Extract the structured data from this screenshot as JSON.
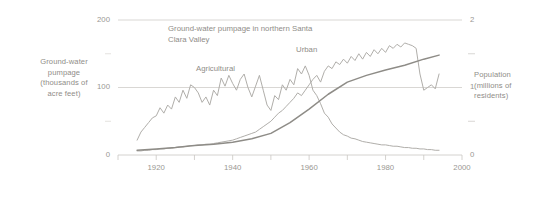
{
  "chart_data": {
    "type": "line",
    "title": "Ground-water pumpage in northern Santa Clara Valley",
    "xlabel": "",
    "ylabel": "Ground-water pumpage (thousands of acre feet)",
    "ylabel_right": "Population (millions of residents)",
    "xlim": [
      1910,
      2000
    ],
    "ylim": [
      0,
      200
    ],
    "ylim_right": [
      0,
      2
    ],
    "grid": true,
    "legend": "inline-annotations",
    "axes": {
      "left": {
        "title_lines": [
          "Ground-water",
          "pumpage",
          "(thousands of",
          "acre feet)"
        ],
        "ticks": [
          0,
          100,
          200
        ],
        "tick_labels": [
          "0",
          "100",
          "200"
        ]
      },
      "right": {
        "title_lines": [
          "Population",
          "(millions of",
          "residents)"
        ],
        "ticks": [
          0,
          1,
          2
        ],
        "tick_labels": [
          "0",
          "1",
          "2"
        ]
      },
      "bottom": {
        "ticks": [
          1910,
          1920,
          1930,
          1940,
          1950,
          1960,
          1970,
          1980,
          1990,
          2000
        ],
        "tick_labels": [
          "",
          "1920",
          "",
          "1940",
          "",
          "1960",
          "",
          "1980",
          "",
          "2000"
        ],
        "labeled": [
          "1920",
          "1940",
          "1960",
          "1980",
          "2000"
        ]
      }
    },
    "series": [
      {
        "name": "Agricultural",
        "axis": "left",
        "units": "thousands of acre feet",
        "color": "#b0aeaa",
        "x": [
          1915,
          1916,
          1917,
          1918,
          1919,
          1920,
          1921,
          1922,
          1923,
          1924,
          1925,
          1926,
          1927,
          1928,
          1929,
          1930,
          1931,
          1932,
          1933,
          1934,
          1935,
          1936,
          1937,
          1938,
          1939,
          1940,
          1941,
          1942,
          1943,
          1944,
          1945,
          1946,
          1947,
          1948,
          1949,
          1950,
          1951,
          1952,
          1953,
          1954,
          1955,
          1956,
          1957,
          1958,
          1959,
          1960,
          1961,
          1962,
          1963,
          1964,
          1965,
          1966,
          1967,
          1968,
          1969,
          1970,
          1971,
          1972,
          1973,
          1974,
          1975,
          1976,
          1977,
          1978,
          1979,
          1980,
          1981,
          1982,
          1983,
          1984,
          1985,
          1986,
          1987,
          1988,
          1989,
          1990,
          1991,
          1992,
          1993,
          1994
        ],
        "values": [
          22,
          34,
          41,
          48,
          55,
          58,
          70,
          62,
          74,
          68,
          86,
          78,
          96,
          84,
          104,
          100,
          92,
          78,
          86,
          74,
          96,
          88,
          114,
          102,
          118,
          106,
          96,
          112,
          120,
          100,
          86,
          102,
          118,
          96,
          74,
          66,
          88,
          82,
          104,
          96,
          112,
          104,
          128,
          120,
          132,
          118,
          96,
          88,
          76,
          62,
          56,
          46,
          40,
          34,
          30,
          28,
          25,
          24,
          22,
          20,
          19,
          18,
          17,
          16,
          15,
          15,
          14,
          13,
          13,
          12,
          11,
          11,
          10,
          10,
          9,
          9,
          8,
          8,
          7,
          7
        ]
      },
      {
        "name": "Urban",
        "axis": "left",
        "units": "thousands of acre feet",
        "color": "#b0aeaa",
        "x": [
          1915,
          1916,
          1917,
          1918,
          1919,
          1920,
          1921,
          1922,
          1923,
          1924,
          1925,
          1926,
          1927,
          1928,
          1929,
          1930,
          1931,
          1932,
          1933,
          1934,
          1935,
          1936,
          1937,
          1938,
          1939,
          1940,
          1941,
          1942,
          1943,
          1944,
          1945,
          1946,
          1947,
          1948,
          1949,
          1950,
          1951,
          1952,
          1953,
          1954,
          1955,
          1956,
          1957,
          1958,
          1959,
          1960,
          1961,
          1962,
          1963,
          1964,
          1965,
          1966,
          1967,
          1968,
          1969,
          1970,
          1971,
          1972,
          1973,
          1974,
          1975,
          1976,
          1977,
          1978,
          1979,
          1980,
          1981,
          1982,
          1983,
          1984,
          1985,
          1986,
          1987,
          1988,
          1989,
          1990,
          1991,
          1992,
          1993,
          1994
        ],
        "values": [
          6,
          6,
          7,
          7,
          8,
          8,
          9,
          9,
          10,
          10,
          11,
          12,
          12,
          13,
          14,
          14,
          15,
          15,
          16,
          16,
          17,
          18,
          19,
          20,
          21,
          22,
          24,
          26,
          28,
          30,
          32,
          34,
          38,
          42,
          46,
          50,
          56,
          62,
          66,
          72,
          78,
          84,
          92,
          88,
          96,
          104,
          112,
          118,
          108,
          124,
          132,
          128,
          138,
          134,
          142,
          136,
          146,
          140,
          150,
          142,
          152,
          146,
          156,
          150,
          158,
          152,
          162,
          158,
          164,
          160,
          166,
          164,
          162,
          158,
          120,
          96,
          100,
          104,
          98,
          120
        ]
      },
      {
        "name": "Population",
        "axis": "right",
        "units": "millions of residents",
        "color": "#8e8c87",
        "x": [
          1915,
          1920,
          1925,
          1930,
          1935,
          1940,
          1945,
          1950,
          1955,
          1960,
          1965,
          1970,
          1975,
          1980,
          1985,
          1990,
          1994
        ],
        "values": [
          0.07,
          0.09,
          0.11,
          0.14,
          0.16,
          0.19,
          0.24,
          0.32,
          0.48,
          0.68,
          0.9,
          1.08,
          1.18,
          1.26,
          1.33,
          1.42,
          1.48
        ]
      }
    ],
    "annotations": [
      {
        "text": "Agricultural",
        "x": 1932,
        "y": 120
      },
      {
        "text": "Urban",
        "x": 1968,
        "y": 160
      }
    ]
  }
}
